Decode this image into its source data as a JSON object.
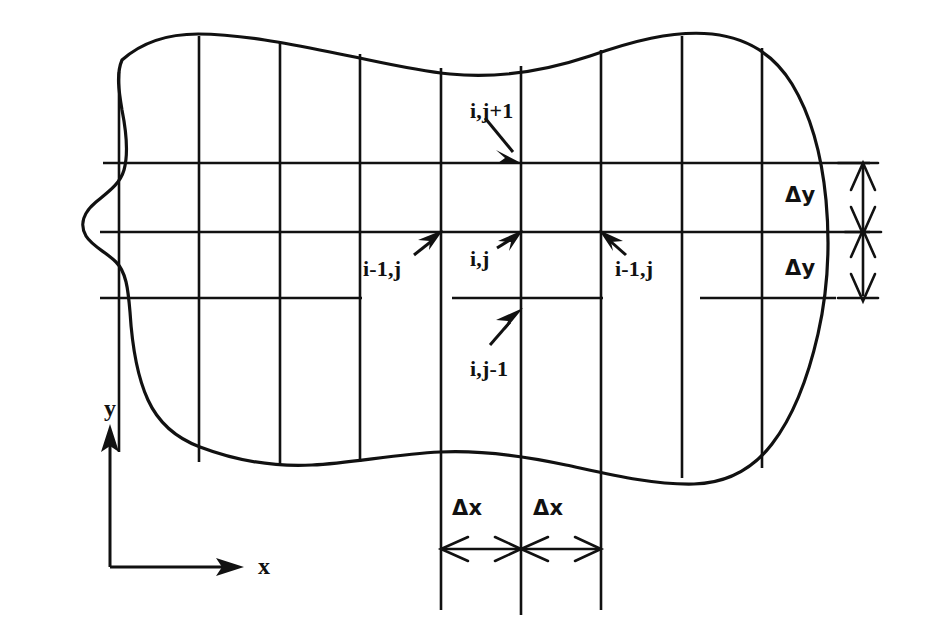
{
  "figure": {
    "type": "diagram",
    "background_color": "#ffffff",
    "line_color": "#111111",
    "canvas": {
      "width": 927,
      "height": 632
    }
  },
  "axes": {
    "x_label": "x",
    "y_label": "y",
    "origin": {
      "x": 110,
      "y": 567
    },
    "x_arrow_tip": {
      "x": 240,
      "y": 567
    },
    "y_arrow_tip": {
      "x": 110,
      "y": 428
    }
  },
  "grid": {
    "vertical_lines_x": [
      119,
      199,
      280,
      360,
      441,
      521,
      601,
      682,
      762
    ],
    "horizontal_lines_y": [
      163,
      232,
      298
    ],
    "spacing_label_x": "Δx",
    "spacing_label_y": "Δy"
  },
  "node_labels": [
    {
      "id": "node-i-j-plus-1",
      "text": "i,j+1",
      "x": 470,
      "y": 100,
      "arrow_to": {
        "x": 521,
        "y": 163
      }
    },
    {
      "id": "node-i-minus-1-j-left",
      "text": "i-1,j",
      "x": 363,
      "y": 258,
      "arrow_to": {
        "x": 441,
        "y": 232
      }
    },
    {
      "id": "node-i-j",
      "text": "i,j",
      "x": 470,
      "y": 248,
      "arrow_to": {
        "x": 521,
        "y": 232
      }
    },
    {
      "id": "node-i-minus-1-j-right",
      "text": "i-1,j",
      "x": 615,
      "y": 258,
      "arrow_to": {
        "x": 601,
        "y": 232
      }
    },
    {
      "id": "node-i-j-minus-1",
      "text": "i,j-1",
      "x": 470,
      "y": 358,
      "arrow_to": {
        "x": 521,
        "y": 298
      }
    }
  ],
  "dimension_labels": [
    {
      "id": "delta-y-upper",
      "text": "Δy",
      "x": 785,
      "y": 185
    },
    {
      "id": "delta-y-lower",
      "text": "Δy",
      "x": 785,
      "y": 258
    },
    {
      "id": "delta-x-left",
      "text": "Δx",
      "x": 452,
      "y": 498
    },
    {
      "id": "delta-x-right",
      "text": "Δx",
      "x": 533,
      "y": 498
    }
  ],
  "dimension_lines": {
    "delta_y": {
      "axis_x": 863,
      "top_y": 163,
      "mid_y": 232,
      "bottom_y": 298
    },
    "delta_x": {
      "axis_y": 549,
      "left_x": 441,
      "mid_x": 521,
      "right_x": 601
    }
  }
}
